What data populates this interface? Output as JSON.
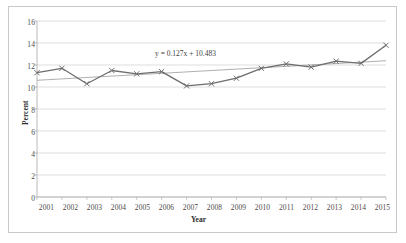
{
  "chart_data": {
    "type": "line",
    "title": "",
    "xlabel": "Year",
    "ylabel": "Percent",
    "categories": [
      "2001",
      "2002",
      "2003",
      "2004",
      "2005",
      "2006",
      "2007",
      "2008",
      "2009",
      "2010",
      "2011",
      "2012",
      "2013",
      "2014",
      "2015"
    ],
    "series": [
      {
        "name": "Percent",
        "values": [
          11.3,
          11.7,
          10.3,
          11.5,
          11.2,
          11.4,
          10.1,
          10.3,
          10.8,
          11.7,
          12.1,
          11.8,
          12.35,
          12.15,
          13.8
        ],
        "marker": "x",
        "color": "#6e6e6e"
      }
    ],
    "trendline": {
      "equation": "y = 0.127x + 10.483",
      "slope": 0.127,
      "intercept": 10.483,
      "color": "#9a9a9a"
    },
    "yticks": [
      0,
      2,
      4,
      6,
      8,
      10,
      12,
      14,
      16
    ],
    "ylim": [
      0,
      16
    ],
    "xlim": [
      "2001",
      "2015"
    ],
    "grid": "horizontal",
    "legend": "none",
    "gridline_color": "#d0d0d0",
    "axis_color": "#a8a8a8",
    "border_color": "#c9c9c9",
    "background": "#ffffff"
  }
}
